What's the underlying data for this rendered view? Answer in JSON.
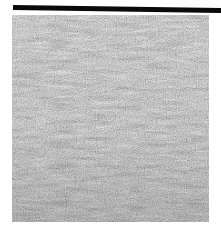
{
  "image": {
    "subject": "grayscale texture of rippled water surface with horizontal streaks",
    "colors": {
      "background": "#ffffff",
      "bar": "#0a0a0a",
      "texture_base": "#c4c4c4",
      "streak_dark": "#5a5a5a",
      "highlight": "#e8e8e8"
    },
    "regions": {
      "top_bar": {
        "x": 13,
        "y": 5,
        "width": 208,
        "height": 5
      },
      "texture": {
        "x": 12,
        "y": 15,
        "width": 197,
        "height": 207
      }
    }
  }
}
